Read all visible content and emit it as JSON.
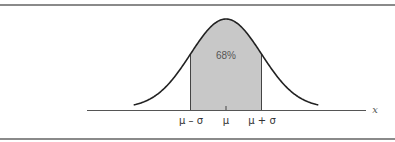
{
  "chart_data": {
    "type": "area",
    "title": "",
    "xlabel": "x",
    "ylabel": "",
    "grid": false,
    "legend": null,
    "x_tick_labels": [
      "μ – σ",
      "μ",
      "μ + σ"
    ],
    "x_ticks_sigma": [
      -1,
      0,
      1
    ],
    "shaded_region": {
      "from_sigma": -1,
      "to_sigma": 1,
      "label": "68%",
      "fill": "#c8c8c8"
    },
    "curve": {
      "distribution": "normal",
      "mean": 0,
      "sd": 1,
      "x_range_sigma": [
        -2.6,
        2.6
      ],
      "color": "#222222"
    },
    "annotations": [
      {
        "text": "68%",
        "position": "center of shaded region"
      }
    ]
  },
  "labels": {
    "area_percent": "68%",
    "tick_minus": "μ – σ",
    "tick_mean": "μ",
    "tick_plus": "μ + σ",
    "axis_x": "x"
  },
  "colors": {
    "curve": "#222222",
    "shade": "#c8c8c8",
    "axis": "#555555",
    "rule": "#8a8a8a"
  }
}
